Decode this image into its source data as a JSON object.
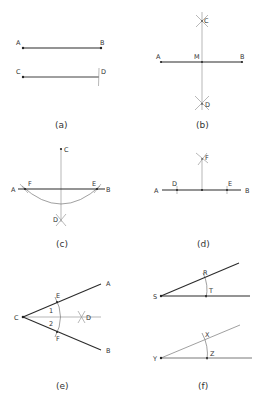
{
  "figures": [
    {
      "id": "a",
      "caption": "(a)",
      "labels": {
        "A": "A",
        "B": "B",
        "C": "C",
        "D": "D"
      },
      "description": "Segment AB and a copy CD of equal length marked with a compass arc"
    },
    {
      "id": "b",
      "caption": "(b)",
      "labels": {
        "A": "A",
        "B": "B",
        "M": "M",
        "C": "C",
        "D": "D"
      },
      "description": "Perpendicular bisector CD of segment AB through midpoint M"
    },
    {
      "id": "c",
      "caption": "(c)",
      "labels": {
        "A": "A",
        "B": "B",
        "C": "C",
        "D": "D",
        "E": "E",
        "F": "F"
      },
      "description": "Perpendicular from external point C to line AB"
    },
    {
      "id": "d",
      "caption": "(d)",
      "labels": {
        "A": "A",
        "B": "B",
        "D": "D",
        "E": "E",
        "F": "F"
      },
      "description": "Perpendicular to line AB at a point on the line"
    },
    {
      "id": "e",
      "caption": "(e)",
      "labels": {
        "A": "A",
        "B": "B",
        "C": "C",
        "D": "D",
        "E": "E",
        "F": "F",
        "angle1": "1",
        "angle2": "2"
      },
      "description": "Bisector CD of angle ACB"
    },
    {
      "id": "f",
      "caption": "(f)",
      "labels": {
        "S": "S",
        "R": "R",
        "T": "T",
        "Y": "Y",
        "X": "X",
        "Z": "Z"
      },
      "description": "Copying angle RST to angle XYZ"
    }
  ],
  "colors": {
    "line": "#2b2b2b",
    "construction": "#9a9a9a",
    "text": "#333333",
    "background": "#ffffff"
  }
}
